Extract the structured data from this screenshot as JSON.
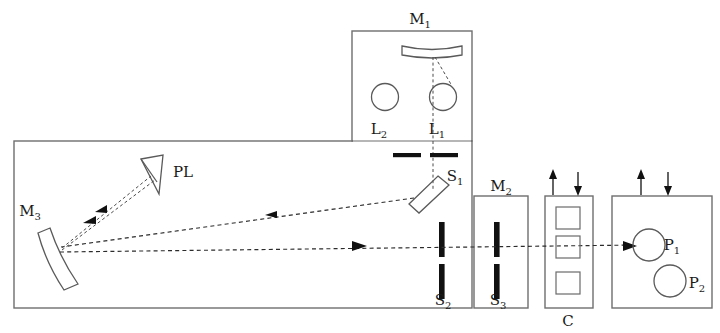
{
  "figure": {
    "domain": "optical-setup-diagram",
    "width": 720,
    "height": 333,
    "background_color": "#ffffff",
    "line_color": "#5a5a5a",
    "ray_color": "#2b2b2b",
    "slit_color": "#111111"
  },
  "labels": {
    "m1": {
      "text": "M",
      "sub": "1"
    },
    "m2": {
      "text": "M",
      "sub": "2"
    },
    "m3": {
      "text": "M",
      "sub": "3"
    },
    "l1": {
      "text": "L",
      "sub": "1"
    },
    "l2": {
      "text": "L",
      "sub": "2"
    },
    "s1": {
      "text": "S",
      "sub": "1"
    },
    "s2": {
      "text": "S",
      "sub": "2"
    },
    "s3": {
      "text": "S",
      "sub": "3"
    },
    "p1": {
      "text": "P",
      "sub": "1"
    },
    "p2": {
      "text": "P",
      "sub": "2"
    },
    "pl": {
      "text": "PL",
      "sub": ""
    },
    "c": {
      "text": "C",
      "sub": ""
    }
  },
  "components": [
    {
      "id": "M1",
      "kind": "concave-mirror",
      "label": "M1",
      "enclosure": "upper-housing"
    },
    {
      "id": "L1",
      "kind": "lens",
      "label": "L1",
      "enclosure": "upper-housing"
    },
    {
      "id": "L2",
      "kind": "lens",
      "label": "L2",
      "enclosure": "upper-housing"
    },
    {
      "id": "S1",
      "kind": "tilted-mirror",
      "label": "S1",
      "enclosure": "main-housing"
    },
    {
      "id": "S2",
      "kind": "slit-pair",
      "label": "S2",
      "enclosure": "main-housing"
    },
    {
      "id": "S3",
      "kind": "slit-pair",
      "label": "S3",
      "enclosure": "m2-housing"
    },
    {
      "id": "M2",
      "kind": "housing",
      "label": "M2",
      "enclosure": "m2-housing"
    },
    {
      "id": "M3",
      "kind": "curved-mirror",
      "label": "M3",
      "enclosure": "main-housing"
    },
    {
      "id": "PL",
      "kind": "prism-wedge",
      "label": "PL",
      "enclosure": "main-housing"
    },
    {
      "id": "C",
      "kind": "cell-stack",
      "label": "C",
      "enclosure": "c-housing"
    },
    {
      "id": "P1",
      "kind": "port",
      "label": "P1",
      "enclosure": "p-housing"
    },
    {
      "id": "P2",
      "kind": "port",
      "label": "P2",
      "enclosure": "p-housing"
    }
  ],
  "enclosures": [
    {
      "id": "upper-housing",
      "x": 352,
      "y": 31,
      "w": 120,
      "h": 110
    },
    {
      "id": "main-housing",
      "x": 14,
      "y": 141,
      "w": 458,
      "h": 167
    },
    {
      "id": "m2-housing",
      "x": 474,
      "y": 196,
      "w": 54,
      "h": 112
    },
    {
      "id": "c-housing",
      "x": 545,
      "y": 196,
      "w": 48,
      "h": 112
    },
    {
      "id": "p-housing",
      "x": 612,
      "y": 196,
      "w": 100,
      "h": 112
    }
  ],
  "flow_arrows": [
    {
      "id": "c-up",
      "direction": "up",
      "x": 553
    },
    {
      "id": "c-down",
      "direction": "down",
      "x": 578
    },
    {
      "id": "p-up",
      "direction": "up",
      "x": 641
    },
    {
      "id": "p-down",
      "direction": "down",
      "x": 668
    }
  ],
  "beam_paths": [
    {
      "id": "m1-to-l1",
      "style": "dashed-fine"
    },
    {
      "id": "m1-to-s1",
      "style": "dashed-fine"
    },
    {
      "id": "s1-to-m3",
      "style": "dashed"
    },
    {
      "id": "m3-to-pl",
      "style": "dashed"
    },
    {
      "id": "m3-horizontal-to-p1",
      "style": "dashed"
    }
  ]
}
